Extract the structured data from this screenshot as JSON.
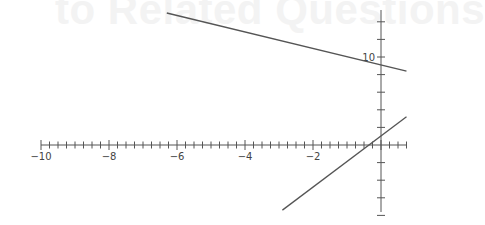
{
  "background_text": "to Related Questions",
  "chart_data": {
    "type": "line",
    "title": "",
    "xlabel": "",
    "ylabel": "",
    "xlim": [
      -10,
      0.75
    ],
    "ylim": [
      -8,
      15
    ],
    "grid": false,
    "x_tick_labels": [
      "-10",
      "-8",
      "-6",
      "-4",
      "-2"
    ],
    "x_ticks": [
      -10,
      -8,
      -6,
      -4,
      -2
    ],
    "x_minor_tick_step": 0.25,
    "y_tick_labels": [
      "10"
    ],
    "y_tick_step": 2,
    "series": [
      {
        "name": "line-1",
        "x": [
          -6.3,
          0.75
        ],
        "y": [
          15.0,
          8.4
        ],
        "color": "#555555"
      },
      {
        "name": "line-2",
        "x": [
          -2.9,
          0.75
        ],
        "y": [
          -7.4,
          3.2
        ],
        "color": "#555555"
      }
    ]
  }
}
